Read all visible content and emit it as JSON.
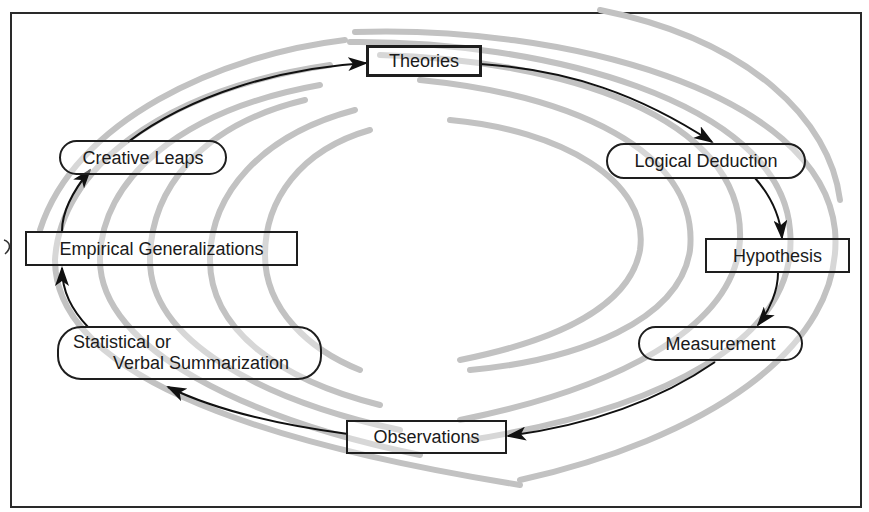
{
  "diagram": {
    "colors": {
      "swirl": "#c2c2c2",
      "arrow": "#111111",
      "box_border": "#1e1e1e",
      "frame": "#2a2a2a"
    },
    "nodes": [
      {
        "id": "theories",
        "label": "Theories",
        "shape": "rectangle"
      },
      {
        "id": "logical_deduction",
        "label": "Logical Deduction",
        "shape": "rounded"
      },
      {
        "id": "hypothesis",
        "label": "Hypothesis",
        "shape": "rectangle"
      },
      {
        "id": "measurement",
        "label": "Measurement",
        "shape": "rounded"
      },
      {
        "id": "observations",
        "label": "Observations",
        "shape": "rectangle"
      },
      {
        "id": "statistical_summarization",
        "label_line1": "Statistical or",
        "label_line2": "Verbal Summarization",
        "shape": "rounded"
      },
      {
        "id": "empirical_generalizations",
        "label": "Empirical Generalizations",
        "shape": "rectangle"
      },
      {
        "id": "creative_leaps",
        "label": "Creative Leaps",
        "shape": "rounded"
      }
    ],
    "edges": [
      {
        "from": "theories",
        "to": "logical_deduction"
      },
      {
        "from": "logical_deduction",
        "to": "hypothesis"
      },
      {
        "from": "hypothesis",
        "to": "measurement"
      },
      {
        "from": "measurement",
        "to": "observations"
      },
      {
        "from": "observations",
        "to": "statistical_summarization"
      },
      {
        "from": "statistical_summarization",
        "to": "empirical_generalizations"
      },
      {
        "from": "empirical_generalizations",
        "to": "creative_leaps"
      },
      {
        "from": "creative_leaps",
        "to": "theories"
      }
    ],
    "direction": "clockwise"
  }
}
